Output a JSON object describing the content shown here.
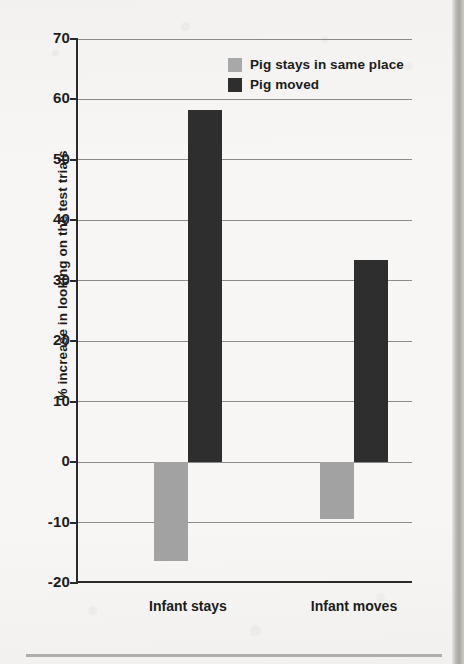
{
  "chart_data": {
    "type": "bar",
    "title": "",
    "xlabel": "",
    "ylabel": "% increase in looking on the test trials",
    "categories": [
      "Infant stays",
      "Infant moves"
    ],
    "series": [
      {
        "name": "Pig stays in same place",
        "color": "#a2a2a2",
        "values": [
          -16.3,
          -9.4
        ]
      },
      {
        "name": "Pig moved",
        "color": "#2e2e2e",
        "values": [
          58.3,
          33.4
        ]
      }
    ],
    "ylim": [
      -20,
      70
    ],
    "ytick_labels": [
      "70",
      "60",
      "50",
      "40",
      "30",
      "20",
      "10",
      "0",
      "-10",
      "-20"
    ],
    "ytick_values": [
      70,
      60,
      50,
      40,
      30,
      20,
      10,
      0,
      -10,
      -20
    ],
    "grid": true,
    "grid_axis": "y",
    "legend_position": "top-right",
    "zero_line": 0
  },
  "legend": {
    "items": [
      {
        "label": "Pig stays in same place",
        "swatch": "light"
      },
      {
        "label": "Pig moved",
        "swatch": "dark"
      }
    ]
  },
  "colors": {
    "light_bar": "#a2a2a2",
    "dark_bar": "#2e2e2e",
    "axis": "#2a2a2a",
    "gridline": "#8c8a88",
    "page_background": "#f7f6f4"
  }
}
